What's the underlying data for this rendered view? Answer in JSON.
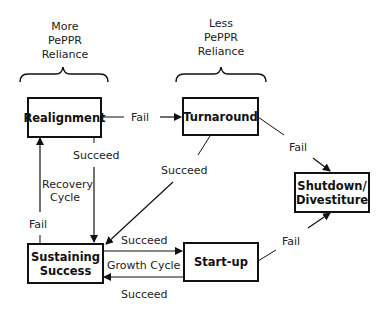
{
  "headers": {
    "left": [
      "More",
      "PePPR",
      "Reliance"
    ],
    "right": [
      "Less",
      "PePPR",
      "Reliance"
    ]
  },
  "nodes": {
    "realignment": "Realignment",
    "turnaround": "Turnaround",
    "sustaining": [
      "Sustaining",
      "Success"
    ],
    "startup": "Start-up",
    "shutdown": [
      "Shutdown/",
      "Divestiture"
    ]
  },
  "edges": {
    "realign_to_turn": "Fail",
    "realign_to_sustain": "Succeed",
    "turn_to_sustain": "Succeed",
    "turn_to_shutdown": "Fail",
    "sustain_to_realign": "Fail",
    "sustain_to_startup": "Succeed",
    "startup_to_sustain": "Succeed",
    "startup_to_shutdown": "Fail"
  },
  "cycles": {
    "recovery": [
      "Recovery",
      "Cycle"
    ],
    "growth": "Growth Cycle"
  }
}
